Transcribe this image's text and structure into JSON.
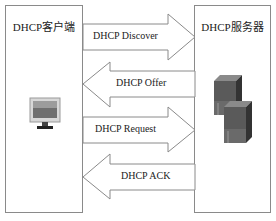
{
  "client": {
    "title": "DHCP客户端",
    "icon": "desktop-monitor-icon"
  },
  "server": {
    "title": "DHCP服务器",
    "icon": "server-towers-icon"
  },
  "messages": [
    {
      "label": "DHCP Discover",
      "direction": "client-to-server"
    },
    {
      "label": "DHCP Offer",
      "direction": "server-to-client"
    },
    {
      "label": "DHCP Request",
      "direction": "client-to-server"
    },
    {
      "label": "DHCP ACK",
      "direction": "server-to-client"
    }
  ],
  "colors": {
    "stroke": "#8a8a8a",
    "background": "#ffffff",
    "text": "#222222"
  }
}
